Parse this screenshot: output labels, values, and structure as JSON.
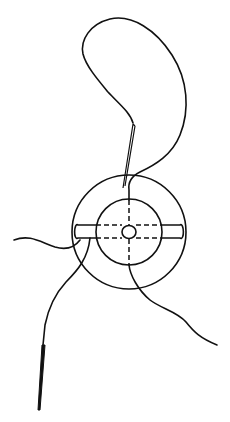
{
  "figure": {
    "type": "line-drawing",
    "colors": {
      "line": "#111111",
      "background": "#ffffff"
    },
    "components": [
      "suture-loop",
      "upper-needle",
      "outer-ring",
      "inner-ring",
      "center-ring",
      "horizontal-bolster",
      "vertical-dashed-axis",
      "left-thread-tail",
      "lower-right-thread-tail",
      "lower-left-thread",
      "lower-needle"
    ]
  },
  "caption": {
    "text": ""
  }
}
